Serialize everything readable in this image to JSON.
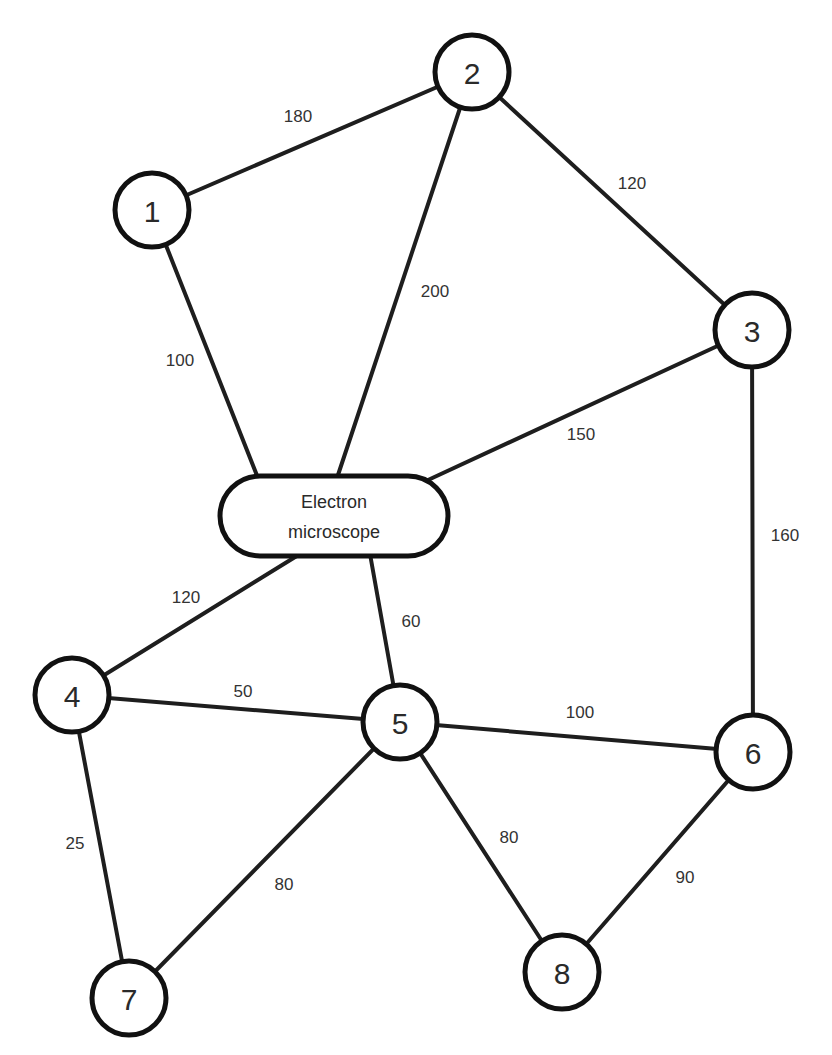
{
  "diagram": {
    "type": "weighted-undirected-graph",
    "hub": {
      "id": "EM",
      "label_line1": "Electron",
      "label_line2": "microscope",
      "x": 220,
      "y": 476,
      "w": 228,
      "h": 80
    },
    "nodes": [
      {
        "id": "1",
        "label": "1",
        "x": 152,
        "y": 210
      },
      {
        "id": "2",
        "label": "2",
        "x": 472,
        "y": 72
      },
      {
        "id": "3",
        "label": "3",
        "x": 752,
        "y": 330
      },
      {
        "id": "4",
        "label": "4",
        "x": 72,
        "y": 695
      },
      {
        "id": "5",
        "label": "5",
        "x": 400,
        "y": 722
      },
      {
        "id": "6",
        "label": "6",
        "x": 753,
        "y": 752
      },
      {
        "id": "7",
        "label": "7",
        "x": 129,
        "y": 998
      },
      {
        "id": "8",
        "label": "8",
        "x": 562,
        "y": 972
      }
    ],
    "node_radius": 37,
    "edges": [
      {
        "from": "1",
        "to": "2",
        "weight": "180",
        "x1": 152,
        "y1": 210,
        "x2": 472,
        "y2": 72,
        "lx": 298,
        "ly": 116
      },
      {
        "from": "1",
        "to": "EM",
        "weight": "100",
        "x1": 152,
        "y1": 210,
        "x2": 258,
        "y2": 478,
        "lx": 180,
        "ly": 360
      },
      {
        "from": "2",
        "to": "EM",
        "weight": "200",
        "x1": 472,
        "y1": 72,
        "x2": 337,
        "y2": 478,
        "lx": 435,
        "ly": 291
      },
      {
        "from": "2",
        "to": "3",
        "weight": "120",
        "x1": 472,
        "y1": 72,
        "x2": 752,
        "y2": 330,
        "lx": 632,
        "ly": 183
      },
      {
        "from": "3",
        "to": "EM",
        "weight": "150",
        "x1": 752,
        "y1": 330,
        "x2": 428,
        "y2": 480,
        "lx": 581,
        "ly": 434
      },
      {
        "from": "3",
        "to": "6",
        "weight": "160",
        "x1": 752,
        "y1": 330,
        "x2": 753,
        "y2": 752,
        "lx": 785,
        "ly": 535
      },
      {
        "from": "EM",
        "to": "4",
        "weight": "120",
        "x1": 300,
        "y1": 554,
        "x2": 72,
        "y2": 695,
        "lx": 186,
        "ly": 597
      },
      {
        "from": "EM",
        "to": "5",
        "weight": "60",
        "x1": 370,
        "y1": 554,
        "x2": 400,
        "y2": 722,
        "lx": 411,
        "ly": 621
      },
      {
        "from": "4",
        "to": "5",
        "weight": "50",
        "x1": 72,
        "y1": 695,
        "x2": 400,
        "y2": 722,
        "lx": 243,
        "ly": 691
      },
      {
        "from": "4",
        "to": "7",
        "weight": "25",
        "x1": 72,
        "y1": 695,
        "x2": 129,
        "y2": 998,
        "lx": 75,
        "ly": 843
      },
      {
        "from": "5",
        "to": "6",
        "weight": "100",
        "x1": 400,
        "y1": 722,
        "x2": 753,
        "y2": 752,
        "lx": 580,
        "ly": 712
      },
      {
        "from": "5",
        "to": "7",
        "weight": "80",
        "x1": 400,
        "y1": 722,
        "x2": 129,
        "y2": 998,
        "lx": 284,
        "ly": 884
      },
      {
        "from": "5",
        "to": "8",
        "weight": "80",
        "x1": 400,
        "y1": 722,
        "x2": 562,
        "y2": 972,
        "lx": 509,
        "ly": 837
      },
      {
        "from": "6",
        "to": "8",
        "weight": "90",
        "x1": 753,
        "y1": 752,
        "x2": 562,
        "y2": 972,
        "lx": 685,
        "ly": 877
      }
    ]
  }
}
